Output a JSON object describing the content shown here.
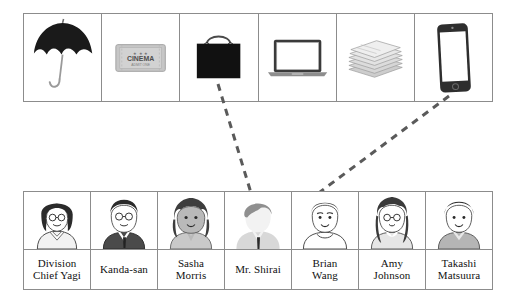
{
  "diagram": {
    "line_color": "#5a5a5a",
    "border_color": "#8c8c8c"
  },
  "items_row": {
    "name": "items-row",
    "items": [
      {
        "id": "umbrella",
        "label": "umbrella",
        "icon": "umbrella-icon",
        "color": "#1a1a1a"
      },
      {
        "id": "ticket",
        "label": "cinema ticket",
        "icon": "ticket-icon",
        "color": "#b9b9b9",
        "ticket_text": "CINEMA",
        "ticket_subtext": "ADMIT ONE",
        "ticket_stars": "★ ★ ★"
      },
      {
        "id": "bag",
        "label": "handbag",
        "icon": "handbag-icon",
        "color": "#111111"
      },
      {
        "id": "laptop",
        "label": "laptop computer",
        "icon": "laptop-icon",
        "color": "#3a3a3a"
      },
      {
        "id": "newspapers",
        "label": "stack of papers",
        "icon": "newspapers-icon",
        "color": "#c3c3c3"
      },
      {
        "id": "smartphone",
        "label": "smartphone",
        "icon": "smartphone-icon",
        "color": "#2e2e2e"
      }
    ]
  },
  "people_row": {
    "name": "people-row",
    "people": [
      {
        "id": "yagi",
        "name": "Division\nChief Yagi",
        "hair": "#2b2b2b",
        "clothes": "#f0f0f0",
        "skin": "#ffffff",
        "glasses": true
      },
      {
        "id": "kanda",
        "name": "Kanda-san",
        "hair": "#2b2b2b",
        "clothes": "#4a4a4a",
        "skin": "#ffffff",
        "glasses": true
      },
      {
        "id": "sasha",
        "name": "Sasha\nMorris",
        "hair": "#3d3d3d",
        "clothes": "#c9c9c9",
        "skin": "#b9b9b9",
        "glasses": false
      },
      {
        "id": "shirai",
        "name": "Mr. Shirai",
        "hair": "#8f8f8f",
        "clothes": "#d8d8d8",
        "skin": "#f2f2f2",
        "glasses": false
      },
      {
        "id": "brian",
        "name": "Brian\nWang",
        "hair": "#3a3a3a",
        "clothes": "#ffffff",
        "skin": "#ffffff",
        "glasses": false
      },
      {
        "id": "amy",
        "name": "Amy\nJohnson",
        "hair": "#3a3a3a",
        "clothes": "#e6e6e6",
        "skin": "#ffffff",
        "glasses": true
      },
      {
        "id": "takashi",
        "name": "Takashi\nMatsuura",
        "hair": "#2f2f2f",
        "clothes": "#b5b5b5",
        "skin": "#ffffff",
        "glasses": false
      }
    ]
  },
  "connections": [
    {
      "id": "bag-to-shirai",
      "from": "bag",
      "to": "shirai"
    },
    {
      "id": "smartphone-to-brian",
      "from": "smartphone",
      "to": "brian"
    }
  ]
}
